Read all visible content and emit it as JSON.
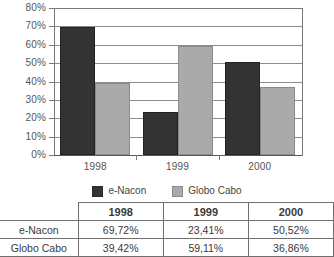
{
  "chart_data": {
    "type": "bar",
    "title": "",
    "xlabel": "",
    "ylabel": "",
    "categories": [
      "1998",
      "1999",
      "2000"
    ],
    "series": [
      {
        "name": "e-Nacon",
        "color": "#333333",
        "values": [
          69.72,
          23.41,
          50.52
        ]
      },
      {
        "name": "Globo Cabo",
        "color": "#aaaaaa",
        "values": [
          39.42,
          59.11,
          36.86
        ]
      }
    ],
    "ylim": [
      0,
      80
    ],
    "ytick_step": 10,
    "ytick_labels": [
      "0%",
      "10%",
      "20%",
      "30%",
      "40%",
      "50%",
      "60%",
      "70%",
      "80%"
    ],
    "grid": "horizontal",
    "legend_position": "bottom"
  },
  "legend": {
    "items": [
      {
        "label": "e-Nacon",
        "swatch": "dark-square-swatch"
      },
      {
        "label": "Globo Cabo",
        "swatch": "gray-square-swatch"
      }
    ]
  },
  "table": {
    "corner_label": "",
    "columns": [
      "1998",
      "1999",
      "2000"
    ],
    "rows": [
      {
        "label": "e-Nacon",
        "values": [
          "69,72%",
          "23,41%",
          "50,52%"
        ]
      },
      {
        "label": "Globo Cabo",
        "values": [
          "39,42%",
          "59,11%",
          "36,86%"
        ]
      }
    ]
  }
}
